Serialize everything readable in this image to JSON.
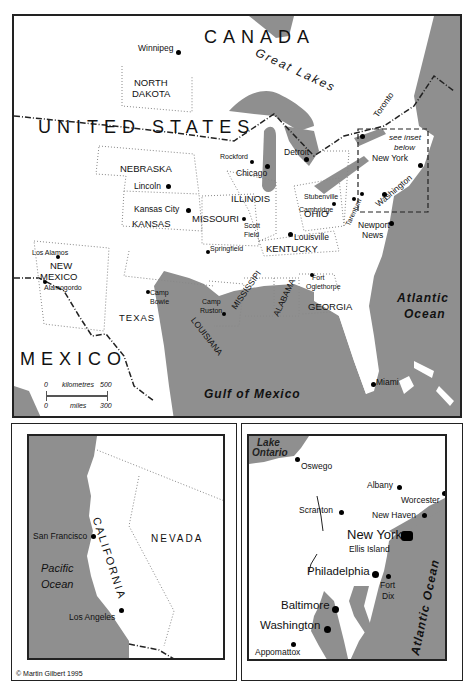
{
  "colors": {
    "water": "#8f8f8f",
    "land": "#ffffff",
    "border": "#222222",
    "text": "#111111"
  },
  "main_map": {
    "countries": {
      "canada": "CANADA",
      "usa": "UNITED STATES",
      "mexico": "MEXICO"
    },
    "water_labels": {
      "great_lakes": "Great Lakes",
      "atlantic_1": "Atlantic",
      "atlantic_2": "Ocean",
      "gulf": "Gulf of Mexico"
    },
    "states": {
      "north_dakota_1": "NORTH",
      "north_dakota_2": "DAKOTA",
      "nebraska": "NEBRASKA",
      "kansas": "KANSAS",
      "missouri": "MISSOURI",
      "illinois": "ILLINOIS",
      "ohio": "OHIO",
      "kentucky": "KENTUCKY",
      "new_mexico_1": "NEW",
      "new_mexico_2": "MEXICO",
      "texas": "TEXAS",
      "louisiana": "LOUISIANA",
      "mississippi": "MISSISSIPI",
      "alabama": "ALABAMA",
      "georgia": "GEORGIA"
    },
    "cities": {
      "winnipeg": "Winnipeg",
      "toronto": "Toronto",
      "detroit": "Detroit",
      "rockford": "Rockford",
      "chicago": "Chicago",
      "lincoln": "Lincoln",
      "kansas_city": "Kansas City",
      "scott_field_1": "Scott",
      "scott_field_2": "Field",
      "springfield": "Springfield",
      "stubenville": "Stubenville",
      "cambridge": "Cambridge",
      "tarentum": "Tarentum",
      "louisville": "Louisville",
      "new_york": "New York",
      "washington": "Washington",
      "newport_news_1": "Newport",
      "newport_news_2": "News",
      "los_alamos": "Los Alamos",
      "alamogordo": "Alamogordo",
      "camp_bowie_1": "Camp",
      "camp_bowie_2": "Bowie",
      "camp_ruston_1": "Camp",
      "camp_ruston_2": "Ruston",
      "fort_oglethorpe_1": "Fort",
      "fort_oglethorpe_2": "Oglethorpe",
      "miami": "Miami"
    },
    "inset_note_1": "see inset",
    "inset_note_2": "below",
    "scale": {
      "km_start": "0",
      "km_label": "kilometres",
      "km_end": "500",
      "mi_start": "0",
      "mi_label": "miles",
      "mi_end": "300"
    }
  },
  "california_inset": {
    "states": {
      "california": "CALIFORNIA",
      "nevada": "NEVADA"
    },
    "cities": {
      "san_francisco": "San Francisco",
      "los_angeles": "Los Angeles"
    },
    "ocean_1": "Pacific",
    "ocean_2": "Ocean",
    "copyright": "© Martin Gilbert 1995"
  },
  "northeast_inset": {
    "lake_1": "Lake",
    "lake_2": "Ontario",
    "ocean": "Atlantic Ocean",
    "cities": {
      "oswego": "Oswego",
      "albany": "Albany",
      "worcester": "Worcester",
      "scranton": "Scranton",
      "new_haven": "New Haven",
      "new_york": "New York",
      "ellis_island": "Ellis Island",
      "philadelphia": "Philadelphia",
      "fort_dix_1": "Fort",
      "fort_dix_2": "Dix",
      "baltimore": "Baltimore",
      "washington": "Washington",
      "appomattox": "Appomattox"
    }
  }
}
